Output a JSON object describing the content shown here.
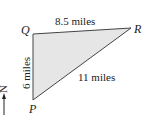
{
  "diagram": {
    "type": "triangle",
    "vertices": {
      "Q": {
        "label": "Q",
        "x": 33,
        "y": 34
      },
      "R": {
        "label": "R",
        "x": 131,
        "y": 28
      },
      "P": {
        "label": "P",
        "x": 33,
        "y": 100
      }
    },
    "sides": {
      "QR": {
        "label": "8.5 miles"
      },
      "QP": {
        "label": "6 miles"
      },
      "PR": {
        "label": "11 miles"
      }
    },
    "compass": {
      "label": "N"
    },
    "colors": {
      "fill": "#e6e6e6",
      "stroke": "#444444",
      "text": "#222222"
    }
  }
}
